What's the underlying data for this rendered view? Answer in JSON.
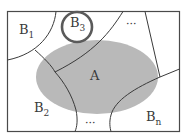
{
  "diagram": {
    "colors": {
      "background": "#ffffff",
      "border": "#4a4a4a",
      "ellipse_fill": "#b9b9b9",
      "highlight_circle": "#5a5a5a",
      "text": "#3a3a3a"
    },
    "labels": {
      "a": "A",
      "b1_base": "B",
      "b1_sub": "1",
      "b2_base": "B",
      "b2_sub": "2",
      "b3_base": "B",
      "b3_sub": "3",
      "bn_base": "B",
      "bn_sub": "n",
      "ellipsis_top": "···",
      "ellipsis_bottom": "···"
    }
  }
}
